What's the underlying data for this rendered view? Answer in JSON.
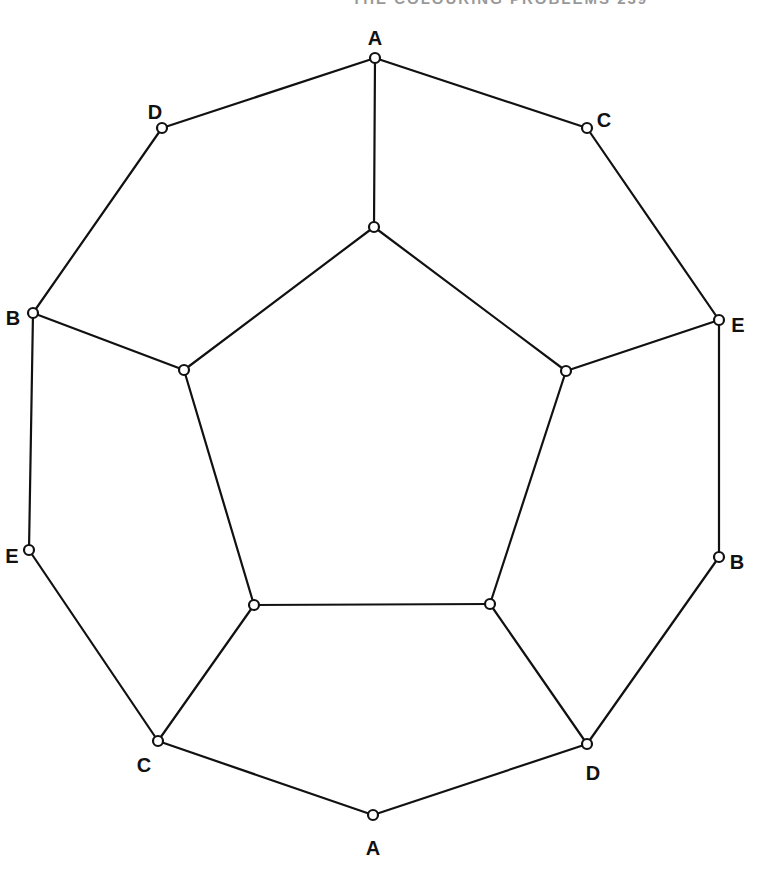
{
  "header": {
    "text": "THE COLOURING PROBLEMS 239"
  },
  "diagram": {
    "vertices": [
      {
        "id": "o1",
        "x": 375,
        "y": 58,
        "label": "A",
        "lx": 375,
        "ly": 40,
        "anchor": "middle"
      },
      {
        "id": "o2",
        "x": 587,
        "y": 128,
        "label": "C",
        "lx": 604,
        "ly": 122,
        "anchor": "middle"
      },
      {
        "id": "o3",
        "x": 719,
        "y": 320,
        "label": "E",
        "lx": 738,
        "ly": 327,
        "anchor": "middle"
      },
      {
        "id": "o4",
        "x": 719,
        "y": 557,
        "label": "B",
        "lx": 737,
        "ly": 564,
        "anchor": "middle"
      },
      {
        "id": "o5",
        "x": 587,
        "y": 744,
        "label": "D",
        "lx": 593,
        "ly": 775,
        "anchor": "middle"
      },
      {
        "id": "o6",
        "x": 373,
        "y": 815,
        "label": "A",
        "lx": 373,
        "ly": 850,
        "anchor": "middle"
      },
      {
        "id": "o7",
        "x": 158,
        "y": 741,
        "label": "C",
        "lx": 144,
        "ly": 767,
        "anchor": "middle"
      },
      {
        "id": "o8",
        "x": 29,
        "y": 550,
        "label": "E",
        "lx": 12,
        "ly": 558,
        "anchor": "middle"
      },
      {
        "id": "o9",
        "x": 33,
        "y": 313,
        "label": "B",
        "lx": 13,
        "ly": 320,
        "anchor": "middle"
      },
      {
        "id": "o10",
        "x": 162,
        "y": 128,
        "label": "D",
        "lx": 155,
        "ly": 114,
        "anchor": "middle"
      },
      {
        "id": "i1",
        "x": 374,
        "y": 227,
        "label": ""
      },
      {
        "id": "i2",
        "x": 566,
        "y": 371,
        "label": ""
      },
      {
        "id": "i3",
        "x": 490,
        "y": 604,
        "label": ""
      },
      {
        "id": "i4",
        "x": 254,
        "y": 605,
        "label": ""
      },
      {
        "id": "i5",
        "x": 184,
        "y": 370,
        "label": ""
      }
    ],
    "edges": [
      [
        "o1",
        "o2"
      ],
      [
        "o2",
        "o3"
      ],
      [
        "o3",
        "o4"
      ],
      [
        "o4",
        "o5"
      ],
      [
        "o5",
        "o6"
      ],
      [
        "o6",
        "o7"
      ],
      [
        "o7",
        "o8"
      ],
      [
        "o8",
        "o9"
      ],
      [
        "o9",
        "o10"
      ],
      [
        "o10",
        "o1"
      ],
      [
        "i1",
        "i2"
      ],
      [
        "i2",
        "i3"
      ],
      [
        "i3",
        "i4"
      ],
      [
        "i4",
        "i5"
      ],
      [
        "i5",
        "i1"
      ],
      [
        "o1",
        "i1"
      ],
      [
        "o3",
        "i2"
      ],
      [
        "o5",
        "i3"
      ],
      [
        "o7",
        "i4"
      ],
      [
        "o9",
        "i5"
      ]
    ]
  }
}
